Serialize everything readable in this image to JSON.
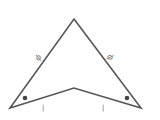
{
  "diagram": {
    "type": "concave-quadrilateral (dart/kite)",
    "colors": {
      "stroke": "#555555",
      "label": "#666666",
      "dot": "#444444",
      "background": "#ffffff"
    },
    "vertices": {
      "apex": [
        74,
        19
      ],
      "left": [
        10,
        108
      ],
      "notch": [
        74,
        88
      ],
      "right": [
        141,
        108
      ]
    },
    "side_labels": {
      "upper_left": "ϕ",
      "upper_right": "ϕ"
    },
    "tick_marks": {
      "lower_left": "|",
      "lower_right": "|"
    },
    "angle_marks": [
      "dot at left base angle",
      "dot at right base angle"
    ]
  }
}
